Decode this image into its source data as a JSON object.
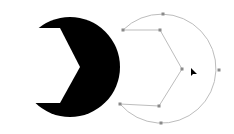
{
  "canvas": {
    "background": "#ffffff",
    "filled_shape": {
      "name": "pacman-crescent",
      "fill": "#000000",
      "circle": {
        "cx": 70,
        "cy": 67,
        "r": 50
      },
      "notch": [
        [
          14,
          28
        ],
        [
          60,
          28
        ],
        [
          80,
          67
        ],
        [
          60,
          103
        ],
        [
          14,
          103
        ]
      ]
    },
    "path_outline": {
      "stroke": "#bdbdbd",
      "anchor_color": "#8a8a8a",
      "anchors": [
        {
          "name": "top",
          "x": 163,
          "y": 14
        },
        {
          "name": "upper-left",
          "x": 123,
          "y": 30
        },
        {
          "name": "upper-inner",
          "x": 160,
          "y": 30
        },
        {
          "name": "tip",
          "x": 182,
          "y": 69
        },
        {
          "name": "right",
          "x": 219,
          "y": 70
        },
        {
          "name": "lower-inner",
          "x": 159,
          "y": 106
        },
        {
          "name": "lower-left",
          "x": 120,
          "y": 104
        },
        {
          "name": "bottom",
          "x": 161,
          "y": 123
        }
      ]
    },
    "cursor": {
      "x": 191,
      "y": 68,
      "color": "#000000"
    }
  }
}
